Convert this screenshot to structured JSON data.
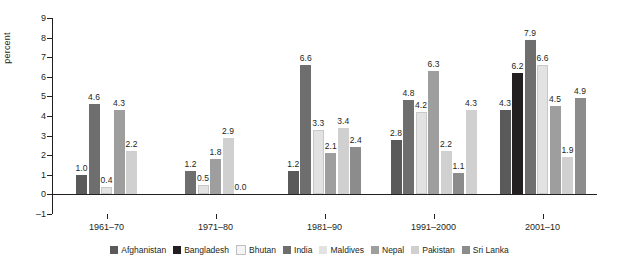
{
  "chart_data": {
    "type": "bar",
    "title": "",
    "xlabel": "",
    "ylabel": "percent",
    "ylim": [
      -1,
      9
    ],
    "yticks": [
      -1,
      0,
      1,
      2,
      3,
      4,
      5,
      6,
      7,
      8,
      9
    ],
    "grid": false,
    "legend_position": "bottom",
    "categories": [
      "1961–70",
      "1971–80",
      "1981–90",
      "1991–2000",
      "2001–10"
    ],
    "series": [
      {
        "name": "Afghanistan",
        "color": "#5a5a5a",
        "values": [
          1.0,
          null,
          1.2,
          2.8,
          4.3
        ],
        "labels": [
          "1.0",
          "",
          "1.2",
          "2.8",
          "4.3"
        ]
      },
      {
        "name": "Bangladesh",
        "color": "#231f20",
        "values": [
          null,
          null,
          null,
          null,
          6.2
        ],
        "labels": [
          "",
          "",
          "",
          "",
          "6.2"
        ]
      },
      {
        "name": "Bhutan",
        "color": "#f0f0f0",
        "values": [
          null,
          null,
          null,
          null,
          null
        ],
        "labels": [
          "",
          "",
          "",
          "",
          ""
        ]
      },
      {
        "name": "India",
        "color": "#6e6e6e",
        "values": [
          4.6,
          1.2,
          6.6,
          4.8,
          7.9
        ],
        "labels": [
          "4.6",
          "1.2",
          "6.6",
          "4.8",
          "7.9"
        ]
      },
      {
        "name": "Maldives",
        "color": "#e2e2e2",
        "values": [
          0.4,
          0.5,
          3.3,
          4.2,
          6.6
        ],
        "labels": [
          "0.4",
          "0.5",
          "3.3",
          "4.2",
          "6.6"
        ]
      },
      {
        "name": "Nepal",
        "color": "#9e9e9e",
        "values": [
          4.3,
          1.8,
          2.1,
          6.3,
          4.5
        ],
        "labels": [
          "4.3",
          "1.8",
          "2.1",
          "6.3",
          "4.5"
        ]
      },
      {
        "name": "Pakistan",
        "color": "#d0d0d0",
        "values": [
          2.2,
          2.9,
          3.4,
          2.2,
          1.9
        ],
        "labels": [
          "2.2",
          "2.9",
          "3.4",
          "2.2",
          "1.9"
        ]
      },
      {
        "name": "Sri Lanka",
        "color": "#8c8c8c",
        "values": [
          null,
          0.0,
          2.4,
          1.1,
          4.9
        ],
        "labels": [
          "",
          "0.0",
          "2.4",
          "1.1",
          "4.9"
        ]
      }
    ],
    "extra_values": [
      {
        "group": "1991–2000",
        "series": "Sri Lanka 2",
        "value": 4.3,
        "label": "4.3",
        "color": "#d0d0d0"
      }
    ]
  },
  "legend": [
    {
      "label": "Afghanistan",
      "color": "#5a5a5a"
    },
    {
      "label": "Bangladesh",
      "color": "#231f20"
    },
    {
      "label": "Bhutan",
      "color": "#f4f4f4"
    },
    {
      "label": "India",
      "color": "#6e6e6e"
    },
    {
      "label": "Maldives",
      "color": "#e2e2e2"
    },
    {
      "label": "Nepal",
      "color": "#9e9e9e"
    },
    {
      "label": "Pakistan",
      "color": "#d0d0d0"
    },
    {
      "label": "Sri Lanka",
      "color": "#8c8c8c"
    }
  ]
}
